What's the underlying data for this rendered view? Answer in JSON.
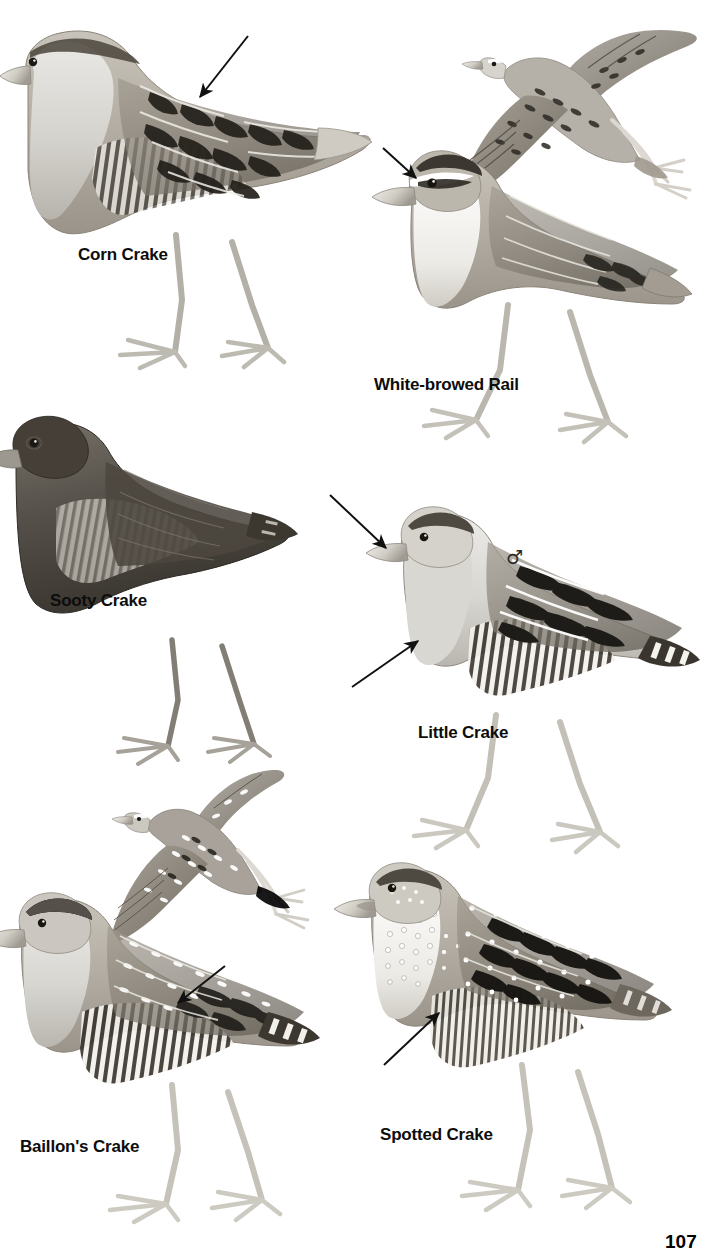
{
  "plate": {
    "title": "Crakes and Rails",
    "page_number": "107",
    "background_color": "#ffffff",
    "ink_color": "#0d0d0d",
    "width": 714,
    "height": 1250
  },
  "species": [
    {
      "id": "corn-crake",
      "label": "Corn Crake",
      "pose": "standing",
      "label_x": 78,
      "label_y": 246,
      "pointer": {
        "from_x": 248,
        "from_y": 36,
        "to_x": 198,
        "to_y": 99
      }
    },
    {
      "id": "white-browed-rail",
      "label": "White-browed Rail",
      "pose": "standing",
      "label_x": 374,
      "label_y": 376,
      "pointer": {
        "from_x": 383,
        "from_y": 148,
        "to_x": 418,
        "to_y": 180
      }
    },
    {
      "id": "white-browed-rail-flight",
      "label": "",
      "pose": "flight",
      "label_x": 0,
      "label_y": 0,
      "pointer": null
    },
    {
      "id": "sooty-crake",
      "label": "Sooty Crake",
      "pose": "standing",
      "label_x": 50,
      "label_y": 592,
      "pointer": null
    },
    {
      "id": "little-crake",
      "label": "Little Crake",
      "pose": "standing",
      "sex": "♂",
      "sex_x": 506,
      "sex_y": 548,
      "label_x": 418,
      "label_y": 724,
      "pointers": [
        {
          "from_x": 330,
          "from_y": 495,
          "to_x": 384,
          "to_y": 546
        },
        {
          "from_x": 352,
          "from_y": 687,
          "to_x": 418,
          "to_y": 639
        }
      ]
    },
    {
      "id": "baillons-crake",
      "label": "Baillon's Crake",
      "pose": "standing",
      "label_x": 20,
      "label_y": 1138,
      "pointer": {
        "from_x": 225,
        "from_y": 966,
        "to_x": 176,
        "to_y": 1005
      }
    },
    {
      "id": "baillons-crake-flight",
      "label": "",
      "pose": "flight",
      "label_x": 0,
      "label_y": 0,
      "pointer": null
    },
    {
      "id": "spotted-crake",
      "label": "Spotted Crake",
      "pose": "standing",
      "label_x": 380,
      "label_y": 1126,
      "pointer": {
        "from_x": 384,
        "from_y": 1065,
        "to_x": 437,
        "to_y": 1015
      }
    }
  ],
  "labels": {
    "corn_crake": "Corn Crake",
    "white_browed_rail": "White-browed Rail",
    "sooty_crake": "Sooty Crake",
    "little_crake": "Little Crake",
    "baillons_crake": "Baillon's Crake",
    "spotted_crake": "Spotted Crake",
    "male_symbol": "♂",
    "page_number": "107"
  }
}
